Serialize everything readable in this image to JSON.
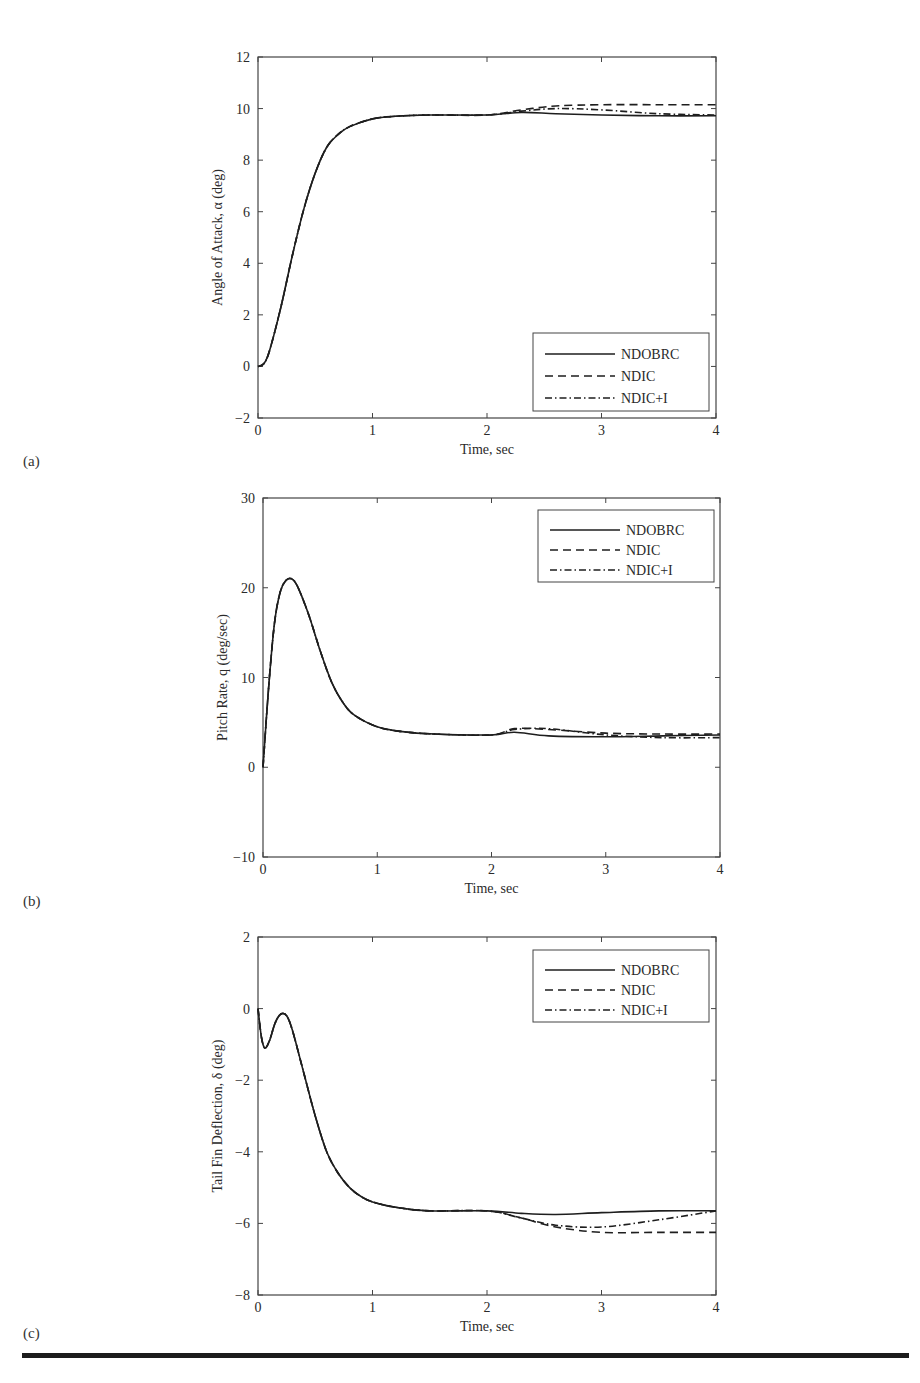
{
  "figure": {
    "panels": [
      "(a)",
      "(b)",
      "(c)"
    ],
    "common_xlabel": "Time, sec"
  },
  "chart_data": [
    {
      "id": "a",
      "type": "line",
      "title": "",
      "xlabel": "Time, sec",
      "ylabel": "Angle of Attack, α (deg)",
      "xlim": [
        0,
        4
      ],
      "ylim": [
        -2,
        12
      ],
      "xticks": [
        "0",
        "1",
        "2",
        "3",
        "4"
      ],
      "yticks": [
        "−2",
        "0",
        "2",
        "4",
        "6",
        "8",
        "10",
        "12"
      ],
      "grid": false,
      "legend_position": "lower right",
      "legend": [
        "NDOBRC",
        "NDIC",
        "NDIC+I"
      ],
      "series": [
        {
          "name": "NDOBRC",
          "style": "solid",
          "x": [
            0,
            0.05,
            0.1,
            0.2,
            0.3,
            0.4,
            0.5,
            0.6,
            0.7,
            0.8,
            1.0,
            1.2,
            1.5,
            2.0,
            2.3,
            2.6,
            3.0,
            3.5,
            4.0
          ],
          "y": [
            0,
            0.1,
            0.6,
            2.3,
            4.3,
            6.1,
            7.5,
            8.5,
            9.0,
            9.3,
            9.6,
            9.7,
            9.75,
            9.75,
            9.85,
            9.8,
            9.75,
            9.72,
            9.72
          ]
        },
        {
          "name": "NDIC",
          "style": "dashed",
          "x": [
            0,
            0.05,
            0.1,
            0.2,
            0.3,
            0.4,
            0.5,
            0.6,
            0.7,
            0.8,
            1.0,
            1.2,
            1.5,
            2.0,
            2.3,
            2.6,
            3.0,
            3.5,
            4.0
          ],
          "y": [
            0,
            0.1,
            0.6,
            2.3,
            4.3,
            6.1,
            7.5,
            8.5,
            9.0,
            9.3,
            9.6,
            9.7,
            9.75,
            9.75,
            9.95,
            10.1,
            10.15,
            10.15,
            10.15
          ]
        },
        {
          "name": "NDIC+I",
          "style": "dashdot",
          "x": [
            0,
            0.05,
            0.1,
            0.2,
            0.3,
            0.4,
            0.5,
            0.6,
            0.7,
            0.8,
            1.0,
            1.2,
            1.5,
            2.0,
            2.3,
            2.6,
            3.0,
            3.5,
            4.0
          ],
          "y": [
            0,
            0.1,
            0.6,
            2.3,
            4.3,
            6.1,
            7.5,
            8.5,
            9.0,
            9.3,
            9.6,
            9.7,
            9.75,
            9.75,
            9.9,
            10.0,
            9.95,
            9.8,
            9.75
          ]
        }
      ]
    },
    {
      "id": "b",
      "type": "line",
      "title": "",
      "xlabel": "Time, sec",
      "ylabel": "Pitch Rate, q (deg/sec)",
      "xlim": [
        0,
        4
      ],
      "ylim": [
        -10,
        30
      ],
      "xticks": [
        "0",
        "1",
        "2",
        "3",
        "4"
      ],
      "yticks": [
        "−10",
        "0",
        "10",
        "20",
        "30"
      ],
      "grid": false,
      "legend_position": "upper right",
      "legend": [
        "NDOBRC",
        "NDIC",
        "NDIC+I"
      ],
      "series": [
        {
          "name": "NDOBRC",
          "style": "solid",
          "x": [
            0,
            0.05,
            0.1,
            0.15,
            0.2,
            0.25,
            0.3,
            0.4,
            0.5,
            0.6,
            0.7,
            0.8,
            1.0,
            1.2,
            1.5,
            2.0,
            2.2,
            2.5,
            3.0,
            3.5,
            4.0
          ],
          "y": [
            0,
            9,
            16,
            19.5,
            20.8,
            21,
            20.2,
            17,
            13,
            9.5,
            7.2,
            5.8,
            4.5,
            4.0,
            3.7,
            3.6,
            3.9,
            3.5,
            3.4,
            3.5,
            3.6
          ]
        },
        {
          "name": "NDIC",
          "style": "dashed",
          "x": [
            0,
            0.05,
            0.1,
            0.15,
            0.2,
            0.25,
            0.3,
            0.4,
            0.5,
            0.6,
            0.7,
            0.8,
            1.0,
            1.2,
            1.5,
            2.0,
            2.2,
            2.5,
            3.0,
            3.5,
            4.0
          ],
          "y": [
            0,
            9,
            16,
            19.5,
            20.8,
            21,
            20.2,
            17,
            13,
            9.5,
            7.2,
            5.8,
            4.5,
            4.0,
            3.7,
            3.6,
            4.3,
            4.2,
            3.8,
            3.7,
            3.7
          ]
        },
        {
          "name": "NDIC+I",
          "style": "dashdot",
          "x": [
            0,
            0.05,
            0.1,
            0.15,
            0.2,
            0.25,
            0.3,
            0.4,
            0.5,
            0.6,
            0.7,
            0.8,
            1.0,
            1.2,
            1.5,
            2.0,
            2.2,
            2.5,
            3.0,
            3.5,
            4.0
          ],
          "y": [
            0,
            9,
            16,
            19.5,
            20.8,
            21,
            20.2,
            17,
            13,
            9.5,
            7.2,
            5.8,
            4.5,
            4.0,
            3.7,
            3.6,
            4.2,
            4.3,
            3.6,
            3.3,
            3.3
          ]
        }
      ]
    },
    {
      "id": "c",
      "type": "line",
      "title": "",
      "xlabel": "Time, sec",
      "ylabel": "Tail Fin Deflection, δ (deg)",
      "xlim": [
        0,
        4
      ],
      "ylim": [
        -8,
        2
      ],
      "xticks": [
        "0",
        "1",
        "2",
        "3",
        "4"
      ],
      "yticks": [
        "−8",
        "−6",
        "−4",
        "−2",
        "0",
        "2"
      ],
      "grid": false,
      "legend_position": "upper right",
      "legend": [
        "NDOBRC",
        "NDIC",
        "NDIC+I"
      ],
      "series": [
        {
          "name": "NDOBRC",
          "style": "solid",
          "x": [
            0,
            0.03,
            0.06,
            0.1,
            0.15,
            0.2,
            0.25,
            0.3,
            0.4,
            0.5,
            0.6,
            0.7,
            0.8,
            0.9,
            1.0,
            1.2,
            1.5,
            2.0,
            2.3,
            2.6,
            3.0,
            3.5,
            4.0
          ],
          "y": [
            0,
            -0.8,
            -1.1,
            -0.9,
            -0.4,
            -0.15,
            -0.2,
            -0.6,
            -1.8,
            -3.0,
            -4.0,
            -4.6,
            -5.0,
            -5.25,
            -5.4,
            -5.55,
            -5.65,
            -5.65,
            -5.72,
            -5.75,
            -5.7,
            -5.65,
            -5.65
          ]
        },
        {
          "name": "NDIC",
          "style": "dashed",
          "x": [
            0,
            0.03,
            0.06,
            0.1,
            0.15,
            0.2,
            0.25,
            0.3,
            0.4,
            0.5,
            0.6,
            0.7,
            0.8,
            0.9,
            1.0,
            1.2,
            1.5,
            2.0,
            2.3,
            2.6,
            3.0,
            3.5,
            4.0
          ],
          "y": [
            0,
            -0.8,
            -1.1,
            -0.9,
            -0.4,
            -0.15,
            -0.2,
            -0.6,
            -1.8,
            -3.0,
            -4.0,
            -4.6,
            -5.0,
            -5.25,
            -5.4,
            -5.55,
            -5.65,
            -5.65,
            -5.85,
            -6.1,
            -6.25,
            -6.25,
            -6.25
          ]
        },
        {
          "name": "NDIC+I",
          "style": "dashdot",
          "x": [
            0,
            0.03,
            0.06,
            0.1,
            0.15,
            0.2,
            0.25,
            0.3,
            0.4,
            0.5,
            0.6,
            0.7,
            0.8,
            0.9,
            1.0,
            1.2,
            1.5,
            2.0,
            2.3,
            2.6,
            3.0,
            3.5,
            4.0
          ],
          "y": [
            0,
            -0.8,
            -1.1,
            -0.9,
            -0.4,
            -0.15,
            -0.2,
            -0.6,
            -1.8,
            -3.0,
            -4.0,
            -4.6,
            -5.0,
            -5.25,
            -5.4,
            -5.55,
            -5.65,
            -5.65,
            -5.85,
            -6.05,
            -6.1,
            -5.9,
            -5.65
          ]
        }
      ]
    }
  ]
}
